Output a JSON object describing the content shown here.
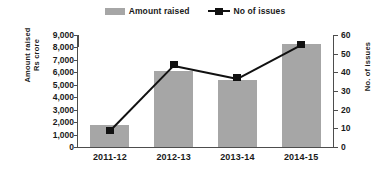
{
  "legend": {
    "items": [
      {
        "label": "Amount raised",
        "icon": "bar-swatch-icon",
        "color": "#a6a6a6"
      },
      {
        "label": "No of issues",
        "icon": "line-marker-swatch-icon",
        "color": "#111111"
      }
    ]
  },
  "axis": {
    "left_title_line1": "Amount raised",
    "left_title_line2": "Rs crore",
    "right_title": "No. of issues"
  },
  "chart_data": {
    "type": "bar",
    "title": "",
    "subtitle": "",
    "categories": [
      "2011-12",
      "2012-13",
      "2013-14",
      "2014-15"
    ],
    "series": [
      {
        "name": "Amount raised",
        "type": "bar",
        "axis": "left",
        "unit": "Rs crore",
        "color": "#a6a6a6",
        "values": [
          1800,
          6100,
          5400,
          8300
        ]
      },
      {
        "name": "No of issues",
        "type": "line",
        "axis": "right",
        "unit": "count",
        "color": "#111111",
        "marker": "square",
        "values": [
          9,
          44,
          37,
          55
        ]
      }
    ],
    "xlabel": "",
    "ylabel": "Amount raised Rs crore",
    "y2label": "No. of issues",
    "ylim": [
      0,
      9000
    ],
    "y2lim": [
      0,
      60
    ],
    "yticks": [
      0,
      1000,
      2000,
      3000,
      4000,
      5000,
      6000,
      7000,
      8000,
      9000
    ],
    "ytick_labels": [
      "0",
      "1,000",
      "2,000",
      "3,000",
      "4,000",
      "5,000",
      "6,000",
      "7,000",
      "8,000",
      "9,000"
    ],
    "y2ticks": [
      0,
      10,
      20,
      30,
      40,
      50,
      60
    ],
    "y2tick_labels": [
      "0",
      "10",
      "20",
      "30",
      "40",
      "50",
      "60"
    ],
    "grid": false,
    "legend_position": "top-center"
  }
}
